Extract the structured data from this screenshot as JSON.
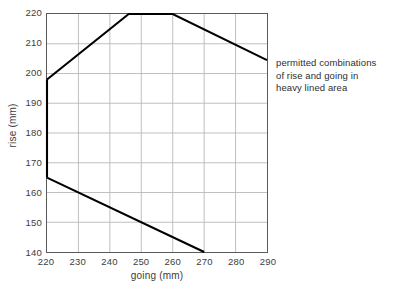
{
  "chart_data": {
    "type": "line",
    "title": "",
    "subtitle": "",
    "xlabel": "going (mm)",
    "ylabel": "rise (mm)",
    "xlim": [
      220,
      290
    ],
    "ylim": [
      140,
      220
    ],
    "xticks": [
      220,
      230,
      240,
      250,
      260,
      270,
      280,
      290
    ],
    "yticks": [
      140,
      150,
      160,
      170,
      180,
      190,
      200,
      210,
      220
    ],
    "grid": true,
    "legend": false,
    "legend_position": "none",
    "annotations": [
      {
        "name": "permitted-region-note",
        "lines": [
          "permitted combinations",
          "of rise and going in",
          "heavy lined area"
        ],
        "x": 292,
        "y": 203
      }
    ],
    "series": [
      {
        "name": "upper boundary",
        "type": "line",
        "style": "heavy",
        "color": "#000000",
        "points": [
          {
            "x": 220,
            "y": 198
          },
          {
            "x": 246,
            "y": 220
          },
          {
            "x": 260,
            "y": 220
          },
          {
            "x": 290,
            "y": 204.5
          }
        ]
      },
      {
        "name": "left boundary",
        "type": "line",
        "style": "heavy",
        "color": "#000000",
        "points": [
          {
            "x": 220,
            "y": 198
          },
          {
            "x": 220,
            "y": 165
          }
        ]
      },
      {
        "name": "lower boundary",
        "type": "line",
        "style": "heavy",
        "color": "#000000",
        "points": [
          {
            "x": 220,
            "y": 165
          },
          {
            "x": 270,
            "y": 140
          }
        ]
      }
    ]
  },
  "colors": {
    "background": "#ffffff",
    "grid": "#b9b9b9",
    "axis": "#5a5a5a",
    "boundary": "#000000",
    "text": "#3c3c3c"
  },
  "bottom_caption": ""
}
